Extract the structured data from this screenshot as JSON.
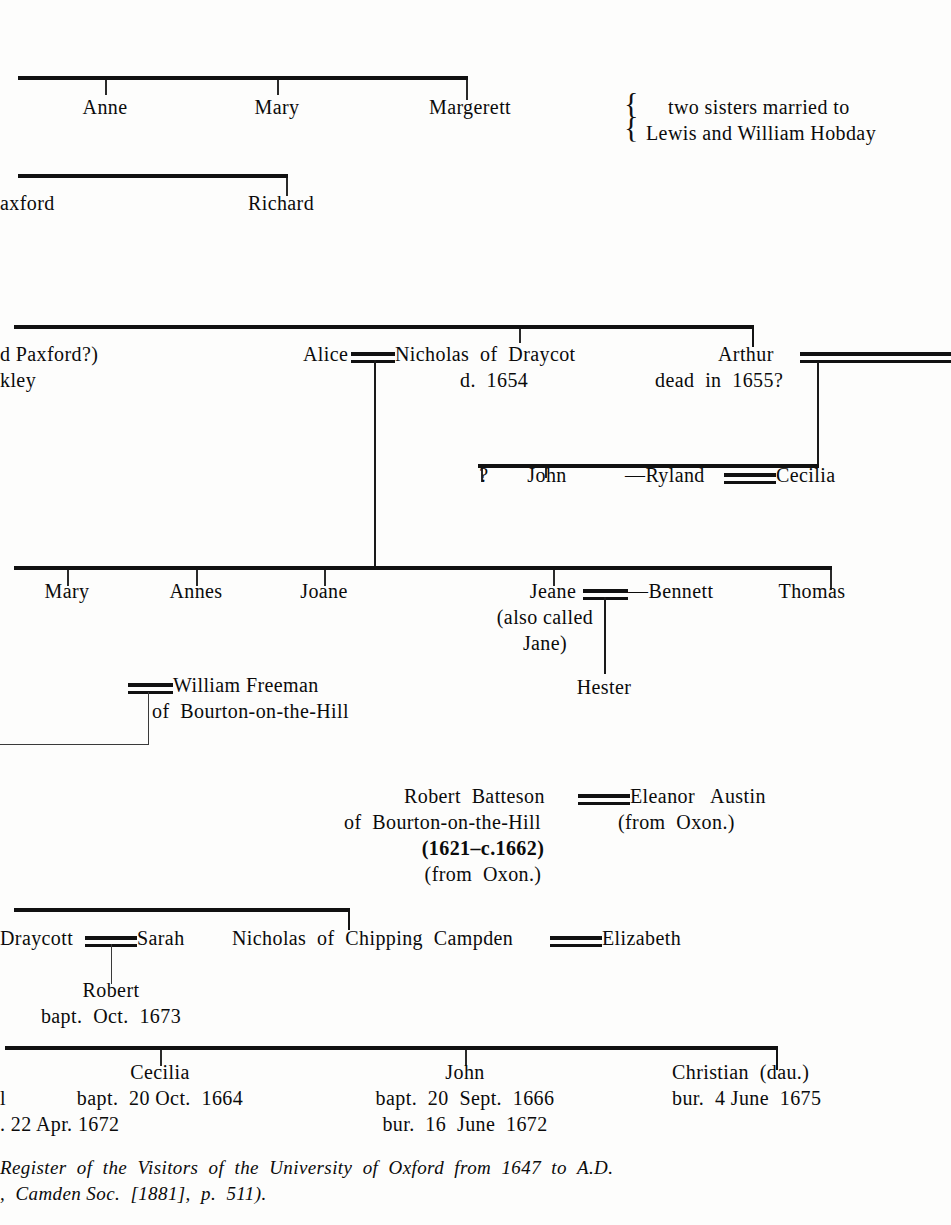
{
  "document": {
    "type": "genealogical-pedigree-chart",
    "family": "Batteson / Paxford pedigree"
  },
  "generation_1": {
    "children": [
      {
        "name": "Anne"
      },
      {
        "name": "Mary"
      },
      {
        "name": "Margerett"
      }
    ],
    "annotation": {
      "line1": "two sisters married to",
      "line2": "Lewis and William Hobday",
      "brace": "{"
    }
  },
  "generation_2": {
    "left_cut": "axford",
    "children": [
      {
        "name": "Richard"
      }
    ]
  },
  "generation_3": {
    "left_cut_line1": "d Paxford?)",
    "left_cut_line2": "kley",
    "alice": "Alice",
    "nicholas": "Nicholas  of  Draycot",
    "nicholas_note": "d.  1654",
    "arthur": "Arthur",
    "arthur_note": "dead  in  1655?"
  },
  "generation_3b": {
    "unknown": "?",
    "john": "John",
    "ryland": "—Ryland",
    "cecilia": "Cecilia"
  },
  "generation_4": {
    "children": [
      {
        "name": "Mary"
      },
      {
        "name": "Annes"
      },
      {
        "name": "Joane"
      },
      {
        "name": "Thomas"
      }
    ],
    "jeane": {
      "name": "Jeane",
      "alias_line1": "(also called",
      "alias_line2": "Jane)",
      "spouse": "—Bennett",
      "child": "Hester"
    }
  },
  "freeman": {
    "name": "William Freeman",
    "residence": "of  Bourton-on-the-Hill"
  },
  "batteson": {
    "name": "Robert  Batteson",
    "residence": "of  Bourton-on-the-Hill",
    "dates": "(1621–c.1662)",
    "origin": "(from  Oxon.)",
    "spouse_name": "Eleanor   Austin",
    "spouse_origin": "(from  Oxon.)"
  },
  "generation_5": {
    "draycott": "Draycott",
    "sarah": "Sarah",
    "robert": "Robert",
    "robert_bapt": "bapt.  Oct.  1673",
    "nicholas_campden": "Nicholas  of  Chipping  Campden",
    "elizabeth": "Elizabeth"
  },
  "generation_6": {
    "left_cut_line1": "l",
    "left_cut_line2": ". 22 Apr. 1672",
    "children": [
      {
        "name": "Cecilia",
        "line1": "bapt.  20 Oct.  1664"
      },
      {
        "name": "John",
        "line1": "bapt.  20  Sept.  1666",
        "line2": "bur.  16  June  1672"
      },
      {
        "name": "Christian  (dau.)",
        "line1": "bur.  4 June  1675"
      }
    ]
  },
  "footnote": {
    "line1": "Register  of  the  Visitors  of  the  University  of  Oxford  from  1647  to  A.D.",
    "line2": ",  Camden Soc.  [1881],  p.  511)."
  }
}
